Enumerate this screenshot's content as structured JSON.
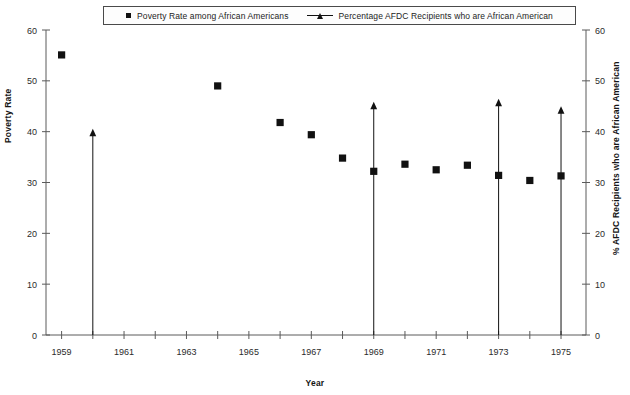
{
  "legend": {
    "entries": [
      {
        "marker": "square-marker",
        "label": "Poverty Rate among African Americans"
      },
      {
        "marker": "triangle-line-marker",
        "label": "Percentage AFDC Recipients who are African American"
      }
    ]
  },
  "axes": {
    "y_left_title": "Poverty Rate",
    "y_right_title": "% AFDC Recipients who are African American",
    "x_title": "Year",
    "y_ticks": [
      "0",
      "10",
      "20",
      "30",
      "40",
      "50",
      "60"
    ],
    "x_ticks": [
      "1959",
      "1961",
      "1963",
      "1965",
      "1967",
      "1969",
      "1971",
      "1973",
      "1975"
    ]
  },
  "colors": {
    "ink": "#111111",
    "axis": "#5a5a5a",
    "background": "#ffffff"
  },
  "chart_data": {
    "type": "scatter",
    "title": "",
    "xlabel": "Year",
    "ylabel": "Poverty Rate",
    "y2label": "% AFDC Recipients who are African American",
    "xlim": [
      1958.5,
      1975.8
    ],
    "ylim": [
      0,
      60
    ],
    "y2lim": [
      0,
      60
    ],
    "grid": false,
    "legend_position": "top-center",
    "x_tick_values": [
      1959,
      1961,
      1963,
      1965,
      1967,
      1969,
      1971,
      1973,
      1975
    ],
    "x_minor_tick_values": [
      1960,
      1962,
      1964,
      1966,
      1968,
      1970,
      1972,
      1974
    ],
    "y_tick_values": [
      0,
      10,
      20,
      30,
      40,
      50,
      60
    ],
    "series": [
      {
        "name": "Poverty Rate among African Americans",
        "marker": "square",
        "axis": "left",
        "points": [
          {
            "x": 1959,
            "y": 55.1
          },
          {
            "x": 1964,
            "y": 49.0
          },
          {
            "x": 1966,
            "y": 41.8
          },
          {
            "x": 1967,
            "y": 39.4
          },
          {
            "x": 1968,
            "y": 34.8
          },
          {
            "x": 1969,
            "y": 32.2
          },
          {
            "x": 1970,
            "y": 33.6
          },
          {
            "x": 1971,
            "y": 32.5
          },
          {
            "x": 1972,
            "y": 33.4
          },
          {
            "x": 1973,
            "y": 31.4
          },
          {
            "x": 1974,
            "y": 30.4
          },
          {
            "x": 1975,
            "y": 31.3
          }
        ]
      },
      {
        "name": "Percentage AFDC Recipients who are African American",
        "marker": "triangle-with-drop-line",
        "axis": "right",
        "points": [
          {
            "x": 1960,
            "y": 39.9
          },
          {
            "x": 1969,
            "y": 45.2
          },
          {
            "x": 1973,
            "y": 45.8
          },
          {
            "x": 1975,
            "y": 44.3
          }
        ]
      }
    ]
  }
}
